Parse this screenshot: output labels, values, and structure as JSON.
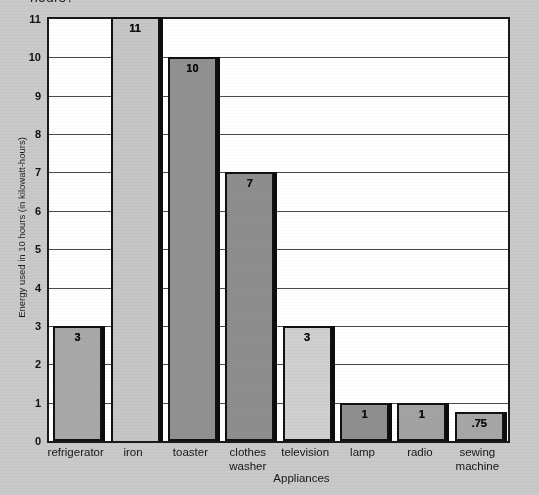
{
  "question_clipped": "hours?",
  "chart_data": {
    "type": "bar",
    "title": "",
    "xlabel": "Appliances",
    "ylabel": "Energy used in 10 hours (in kilowatt-hours)",
    "categories": [
      "refrigerator",
      "iron",
      "toaster",
      "clothes washer",
      "television",
      "lamp",
      "radio",
      "sewing machine"
    ],
    "category_lines": [
      [
        "refrigerator"
      ],
      [
        "iron"
      ],
      [
        "toaster"
      ],
      [
        "clothes",
        "washer"
      ],
      [
        "television"
      ],
      [
        "lamp"
      ],
      [
        "radio"
      ],
      [
        "sewing",
        "machine"
      ]
    ],
    "values": [
      3,
      11,
      10,
      7,
      3,
      1,
      1,
      0.75
    ],
    "value_labels": [
      "3",
      "11",
      "10",
      "7",
      "3",
      "1",
      "1",
      ".75"
    ],
    "bar_colors": [
      "#a8a8a8",
      "#c6c6c6",
      "#919191",
      "#8e8e8e",
      "#cfcfcf",
      "#8f8f8f",
      "#a3a3a3",
      "#a6a6a6"
    ],
    "ylim": [
      0,
      11
    ],
    "yticks": [
      "0",
      "1",
      "2",
      "3",
      "4",
      "5",
      "6",
      "7",
      "8",
      "9",
      "10",
      "11"
    ],
    "grid": true,
    "legend": "none",
    "axis_color": "#1a1a1a",
    "plot_background": "#ffffff",
    "page_background": "#c9c9c9"
  }
}
